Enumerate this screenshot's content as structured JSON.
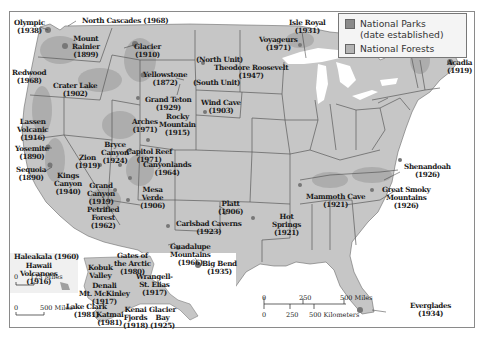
{
  "legend": {
    "items": [
      {
        "label_line1": "National Parks",
        "label_line2": "(date established)",
        "color": "#8a8a8a"
      },
      {
        "label_line1": "National Forests",
        "label_line2": "",
        "color": "#b3b3b3"
      }
    ]
  },
  "colors": {
    "land": "#c6c6c6",
    "forest": "#b0b0b0",
    "park": "#8a8a8a",
    "water": "#ffffff",
    "borders": "#5a5a5a"
  },
  "parks": [
    {
      "name": "Olympic",
      "year": "(1938)"
    },
    {
      "name": "North Cascades (1968)",
      "year": ""
    },
    {
      "name": "Mount",
      "name2": "Rainier",
      "year": "(1899)"
    },
    {
      "name": "Glacier",
      "year": "(1910)"
    },
    {
      "name": "Redwood",
      "year": "(1968)"
    },
    {
      "name": "Crater Lake",
      "year": "(1902)"
    },
    {
      "name": "Yellowstone",
      "year": "(1872)"
    },
    {
      "name": "(North Unit)",
      "year": ""
    },
    {
      "name": "Theodore Roosevelt",
      "year": "(1947)"
    },
    {
      "name": "(South Unit)",
      "year": ""
    },
    {
      "name": "Isle Royal",
      "year": "(1931)"
    },
    {
      "name": "Voyageurs",
      "year": "(1971)"
    },
    {
      "name": "Acadia",
      "year": "(1919)"
    },
    {
      "name": "Grand Teton",
      "year": "(1929)"
    },
    {
      "name": "Wind Cave",
      "year": "(1903)"
    },
    {
      "name": "Lassen",
      "name2": "Volcanic",
      "year": "(1916)"
    },
    {
      "name": "Arches",
      "year": "(1971)"
    },
    {
      "name": "Rocky",
      "name2": "Mountain",
      "year": "(1915)"
    },
    {
      "name": "Yosemite",
      "year": "(1890)"
    },
    {
      "name": "Bryce",
      "name2": "Canyon",
      "year": "(1924)"
    },
    {
      "name": "Capitol Reef",
      "year": "(1971)"
    },
    {
      "name": "Zion",
      "year": "(1919)"
    },
    {
      "name": "Canyonlands",
      "year": "(1964)"
    },
    {
      "name": "Sequoia",
      "year": "(1890)"
    },
    {
      "name": "Kings",
      "name2": "Canyon",
      "year": "(1940)"
    },
    {
      "name": "Grand",
      "name2": "Canyon",
      "year": "(1919)"
    },
    {
      "name": "Mesa",
      "name2": "Verde",
      "year": "(1906)"
    },
    {
      "name": "Petrified",
      "name2": "Forest",
      "year": "(1962)"
    },
    {
      "name": "Platt",
      "year": "(1906)"
    },
    {
      "name": "Carlsbad Caverns",
      "year": "(1923)"
    },
    {
      "name": "Guadalupe",
      "name2": "Mountains",
      "year": "(1966)"
    },
    {
      "name": "Big Bend",
      "year": "(1935)"
    },
    {
      "name": "Hot",
      "name2": "Springs",
      "year": "(1921)"
    },
    {
      "name": "Mammoth Cave",
      "year": "(1921)"
    },
    {
      "name": "Shenandoah",
      "year": "(1926)"
    },
    {
      "name": "Great Smoky",
      "name2": "Mountains",
      "year": "(1926)"
    },
    {
      "name": "Everglades",
      "year": "(1934)"
    },
    {
      "name": "Haleakala (1960)",
      "year": ""
    },
    {
      "name": "Hawaii",
      "name2": "Volcanoes",
      "year": "(1916)"
    },
    {
      "name": "Gates of",
      "name2": "the Arctic",
      "year": "(1980)"
    },
    {
      "name": "Kobuk",
      "name2": "Valley",
      "year": "(1980)"
    },
    {
      "name": "Denali",
      "name2": "Mt. McKinley",
      "year": "(1917)"
    },
    {
      "name": "Wrangell-",
      "name2": "St. Elias",
      "year": "(1917)"
    },
    {
      "name": "Lake Clark",
      "year": "(1981)"
    },
    {
      "name": "Katmai",
      "year": "(1981)"
    },
    {
      "name": "Kenai",
      "name2": "Fjords",
      "year": "(1918)"
    },
    {
      "name": "Glacier",
      "name2": "Bay",
      "year": "(1925)"
    }
  ],
  "scales": {
    "hawaii": {
      "zero": "0",
      "max": "125 Miles"
    },
    "alaska": {
      "zero": "0",
      "max": "500 Miles"
    },
    "main": {
      "miles": [
        "0",
        "250",
        "500 Miles"
      ],
      "km": [
        "0",
        "250",
        "500 Kilometers"
      ]
    }
  }
}
